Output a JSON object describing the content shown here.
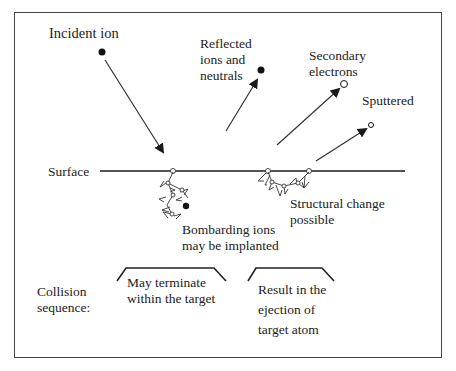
{
  "labels": {
    "incident_ion": "Incident ion",
    "reflected_1": "Reflected",
    "reflected_2": "ions and",
    "reflected_3": "neutrals",
    "secondary_1": "Secondary",
    "secondary_2": "electrons",
    "sputtered": "Sputtered",
    "surface": "Surface",
    "structural_1": "Structural change",
    "structural_2": "possible",
    "bombarding_1": "Bombarding ions",
    "bombarding_2": "may be implanted",
    "collision_1": "Collision",
    "collision_2": "sequence:",
    "terminate_1": "May terminate",
    "terminate_2": "within the target",
    "result_1": "Result in the",
    "result_2": "ejection of",
    "result_3": "target atom"
  },
  "colors": {
    "line": "#1a1a1a",
    "text": "#222222",
    "border": "#444444"
  }
}
